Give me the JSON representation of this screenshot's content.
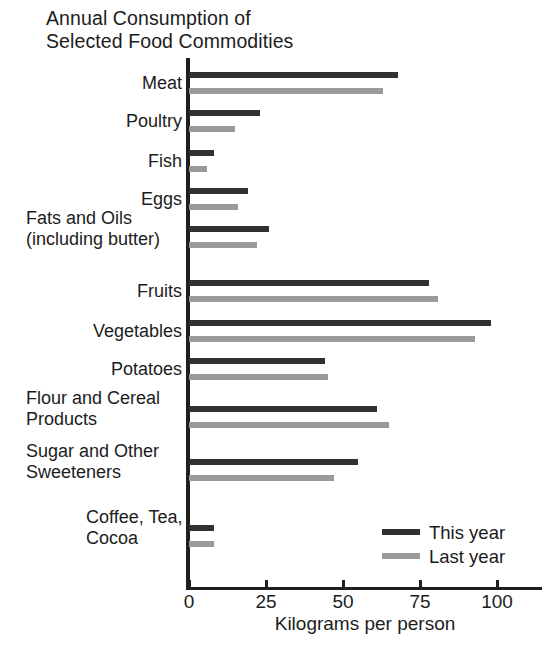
{
  "chart_data": {
    "type": "bar",
    "orientation": "horizontal",
    "title": "Annual Consumption of\nSelected Food Commodities",
    "xlabel": "Kilograms per person",
    "ylabel": "",
    "xlim": [
      0,
      108
    ],
    "xticks": [
      0,
      25,
      50,
      75,
      100
    ],
    "xtick_labels": [
      "0",
      "25",
      "50",
      "75",
      "100"
    ],
    "grid": false,
    "legend_position": "inside-lower-right",
    "categories": [
      "Meat",
      "Poultry",
      "Fish",
      "Eggs",
      "Fats and Oils\n(including butter)",
      "Fruits",
      "Vegetables",
      "Potatoes",
      "Flour and Cereal\nProducts",
      "Sugar and Other\nSweeteners",
      "Coffee, Tea,\nCocoa"
    ],
    "series": [
      {
        "name": "This year",
        "color": "#313131",
        "values": [
          68,
          23,
          8,
          19,
          26,
          78,
          98,
          44,
          61,
          55,
          8
        ]
      },
      {
        "name": "Last year",
        "color": "#9a9a9a",
        "values": [
          63,
          15,
          6,
          16,
          22,
          81,
          93,
          45,
          65,
          47,
          8
        ]
      }
    ]
  },
  "colors": {
    "this_year": "#313131",
    "last_year": "#9a9a9a",
    "axis": "#1f1f1f",
    "text": "#1c1c1c",
    "background": "#ffffff"
  },
  "legend": {
    "items": [
      {
        "label": "This year"
      },
      {
        "label": "Last year"
      }
    ]
  }
}
